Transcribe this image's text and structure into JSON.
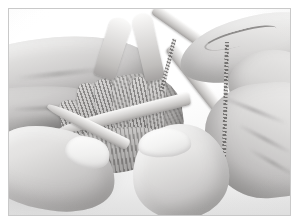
{
  "image": {
    "kind": "photograph",
    "subject": "hands-knitting-with-double-pointed-needles",
    "description": "Close-up photograph of two hands holding knitting in progress on double-pointed needles, working yarn draped over the right index finger",
    "color_mode": "desaturated grayscale",
    "alt_text": "Two hands knitting in the round on double-pointed needles"
  },
  "frame": {
    "border_color": "#c9c9c9",
    "matte_color": "#ffffff",
    "border_width_px": 1,
    "matte_width_px": 8
  },
  "palette": {
    "background": "#ffffff",
    "backdrop": "#fbfbfb",
    "skin_highlight": "#f4f1ef",
    "skin_midtone": "#d2cbc7",
    "skin_shadow": "#9a918d",
    "needle_highlight": "#faf7f4",
    "needle_shadow": "#ab9f96",
    "yarn_dark": "#6c635c",
    "yarn_light": "#cec6be",
    "table_surface": "#e8e8e8"
  },
  "elements": {
    "left_hand": {
      "name": "left hand",
      "parts": [
        "index finger",
        "middle finger",
        "thumb",
        "thumbnail"
      ]
    },
    "right_hand": {
      "name": "right hand",
      "parts": [
        "index finger",
        "knuckle",
        "palm",
        "thumb",
        "thumbnail"
      ]
    },
    "needles": {
      "name": "double-pointed knitting needles",
      "count": 6,
      "material": "wood",
      "labels": [
        "upper-left needle",
        "upper-right needle",
        "upper-right diagonal needle",
        "lower-right diagonal needle",
        "horizontal needle",
        "lower-left needle"
      ]
    },
    "fabric": {
      "name": "knitted fabric on needles",
      "stitch_columns": 6,
      "texture": "ribbed knit stitches"
    },
    "yarn": {
      "name": "working yarn",
      "strands": [
        "wrap around right index finger",
        "long dropped strand",
        "working strand to stitches"
      ]
    }
  }
}
